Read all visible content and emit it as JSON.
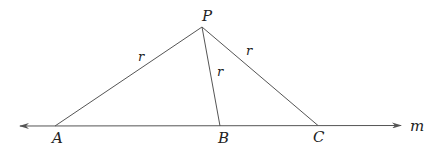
{
  "diagram": {
    "line": {
      "label": "m",
      "arrows": "both"
    },
    "points": {
      "P": {
        "label": "P"
      },
      "A": {
        "label": "A"
      },
      "B": {
        "label": "B"
      },
      "C": {
        "label": "C"
      }
    },
    "segments": {
      "PA": {
        "label": "r"
      },
      "PB": {
        "label": "r"
      },
      "PC": {
        "label": "r"
      }
    },
    "colors": {
      "stroke": "#555555",
      "text": "#222222",
      "background": "#ffffff"
    }
  }
}
